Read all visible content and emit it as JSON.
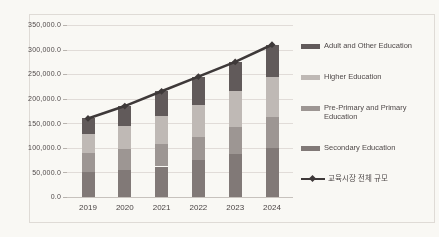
{
  "chart_data": {
    "type": "bar",
    "subtype": "stacked-bars-with-total-line",
    "title": "",
    "xlabel": "",
    "ylabel": "",
    "grid": true,
    "legend_position": "right",
    "ylim": [
      0,
      350000
    ],
    "y_ticks": [
      {
        "value": 0,
        "label": "0.0"
      },
      {
        "value": 50000,
        "label": "50,000.0"
      },
      {
        "value": 100000,
        "label": "100,000.0"
      },
      {
        "value": 150000,
        "label": "150,000.0"
      },
      {
        "value": 200000,
        "label": "200,000.0"
      },
      {
        "value": 250000,
        "label": "250,000.0"
      },
      {
        "value": 300000,
        "label": "300,000.0"
      },
      {
        "value": 350000,
        "label": "350,000.0"
      }
    ],
    "categories": [
      "2019",
      "2020",
      "2021",
      "2022",
      "2023",
      "2024"
    ],
    "series": [
      {
        "name": "Adult and Other Education",
        "color": "#5d5657",
        "values": [
          32000,
          40000,
          50000,
          58000,
          60000,
          65000
        ]
      },
      {
        "name": "Higher Education",
        "color": "#c0bbba",
        "values": [
          38000,
          48000,
          58000,
          64000,
          72000,
          83000
        ]
      },
      {
        "name": "Pre-Primary and Primary Education",
        "color": "#9d9695",
        "values": [
          40000,
          42000,
          45000,
          48000,
          55000,
          62000
        ]
      },
      {
        "name": "Secondary Education",
        "color": "#7f7777",
        "values": [
          50000,
          55000,
          62000,
          75000,
          88000,
          100000
        ]
      }
    ],
    "stack_order_bottom_to_top": [
      "Secondary Education",
      "Pre-Primary and Primary Education",
      "Higher Education",
      "Adult and Other Education"
    ],
    "line_series": {
      "name": "교육시장 전체 규모",
      "color": "#383334",
      "values": [
        160000,
        185000,
        215000,
        245000,
        275000,
        310000
      ]
    }
  },
  "colors": {
    "gridline": "#e4e1df",
    "axis_text": "#4c4747",
    "border": "#e2dfdd",
    "background": "#fefefe"
  }
}
